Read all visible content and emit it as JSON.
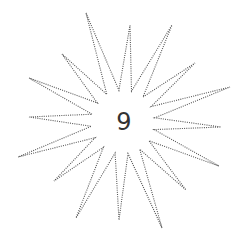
{
  "figure": {
    "label": "9",
    "shape": "16-point dotted star",
    "stroke_color": "#555555",
    "label_color": "#333333",
    "center": [
      123,
      122
    ],
    "outer_tips": [
      [
        86,
        13
      ],
      [
        130,
        25
      ],
      [
        172,
        25
      ],
      [
        195,
        63
      ],
      [
        230,
        87
      ],
      [
        221,
        127
      ],
      [
        219,
        166
      ],
      [
        186,
        190
      ],
      [
        162,
        228
      ],
      [
        119,
        220
      ],
      [
        76,
        218
      ],
      [
        54,
        181
      ],
      [
        18,
        157
      ],
      [
        29,
        117
      ],
      [
        29,
        78
      ],
      [
        62,
        54
      ]
    ],
    "inner_radius": 32
  }
}
